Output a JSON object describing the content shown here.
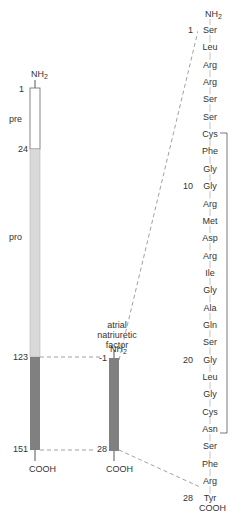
{
  "precursor": {
    "n_terminus": "NH2",
    "c_terminus": "COOH",
    "segments": [
      {
        "name": "pre",
        "start": 1,
        "end": 24,
        "color": "#ffffff"
      },
      {
        "name": "pro",
        "start": 24,
        "end": 123,
        "color": "#d9d9d9"
      },
      {
        "name": "",
        "start": 123,
        "end": 151,
        "color": "#808080"
      }
    ],
    "markers": [
      "1",
      "24",
      "123",
      "151"
    ],
    "labels": {
      "pre": "pre",
      "pro": "pro"
    }
  },
  "mature": {
    "title_lines": [
      "atrial",
      "natriuretic",
      "factor"
    ],
    "n_terminus": "NH2",
    "c_terminus": "COOH",
    "start_label": "1",
    "end_label": "28",
    "color": "#808080"
  },
  "sequence": {
    "n_terminus": "NH2",
    "c_terminus": "COOH",
    "residues": [
      "Ser",
      "Leu",
      "Arg",
      "Arg",
      "Ser",
      "Ser",
      "Cys",
      "Phe",
      "Gly",
      "Gly",
      "Arg",
      "Met",
      "Asp",
      "Arg",
      "Ile",
      "Gly",
      "Ala",
      "Gln",
      "Ser",
      "Gly",
      "Leu",
      "Gly",
      "Cys",
      "Asn",
      "Ser",
      "Phe",
      "Arg",
      "Tyr"
    ],
    "position_labels": [
      {
        "index": 1,
        "label": "1"
      },
      {
        "index": 10,
        "label": "10"
      },
      {
        "index": 20,
        "label": "20"
      },
      {
        "index": 28,
        "label": "28"
      }
    ],
    "disulfide_bond": {
      "from": 7,
      "to": 23
    }
  }
}
